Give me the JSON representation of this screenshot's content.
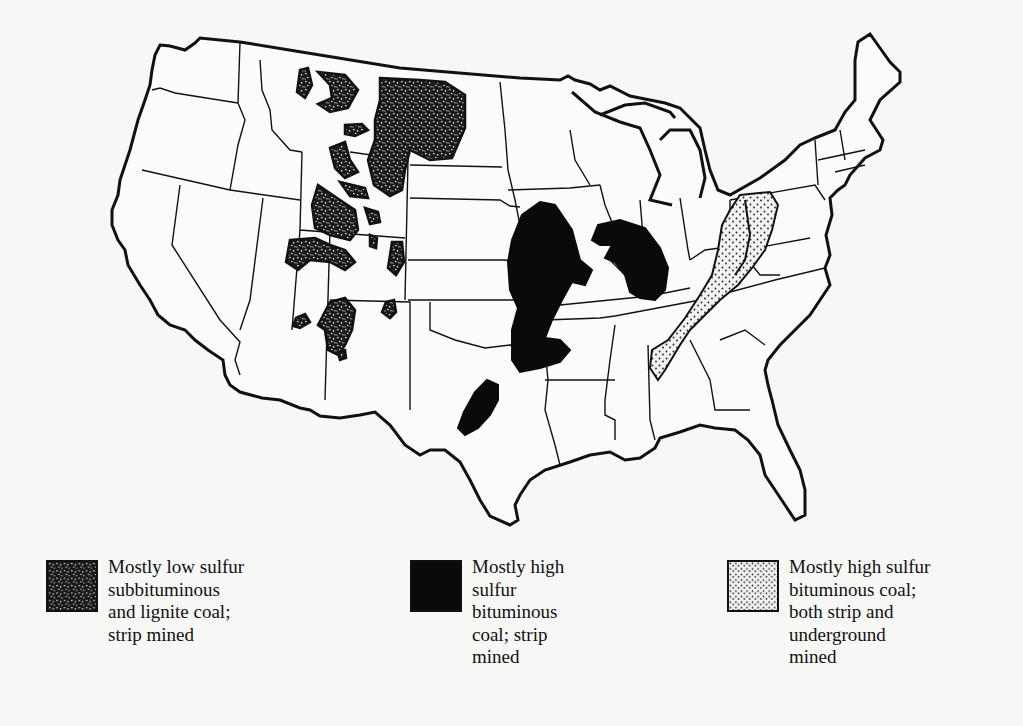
{
  "figure": {
    "colors": {
      "background": "#f7f7f5",
      "outline": "#111111",
      "high_sulfur_strip": "#0a0a0a",
      "low_sulfur_fill": "#1a1a1a",
      "bituminous_dots": "#f2f2ef"
    }
  },
  "legend": [
    {
      "id": "low-sulfur-subbituminous",
      "pattern": "dense-speckled",
      "lines": [
        "Mostly low sulfur",
        "subbituminous",
        "and lignite coal;",
        "strip mined"
      ]
    },
    {
      "id": "high-sulfur-strip",
      "pattern": "solid-black",
      "lines": [
        "Mostly high",
        "sulfur",
        "bituminous",
        "coal; strip",
        "mined"
      ]
    },
    {
      "id": "high-sulfur-bituminous",
      "pattern": "light-stippled",
      "lines": [
        "Mostly high sulfur",
        "bituminous coal;",
        "both strip and",
        "underground",
        "mined"
      ]
    }
  ],
  "regions": [
    {
      "name": "Northern Great Plains / Powder River",
      "legend": "low-sulfur-subbituminous"
    },
    {
      "name": "Rocky Mountain basins",
      "legend": "low-sulfur-subbituminous"
    },
    {
      "name": "Western Interior (Iowa-Missouri-Kansas-Oklahoma)",
      "legend": "high-sulfur-strip"
    },
    {
      "name": "Illinois Basin",
      "legend": "high-sulfur-strip"
    },
    {
      "name": "Texas (Fort Worth basin)",
      "legend": "high-sulfur-strip"
    },
    {
      "name": "Appalachian Basin",
      "legend": "high-sulfur-bituminous"
    }
  ]
}
